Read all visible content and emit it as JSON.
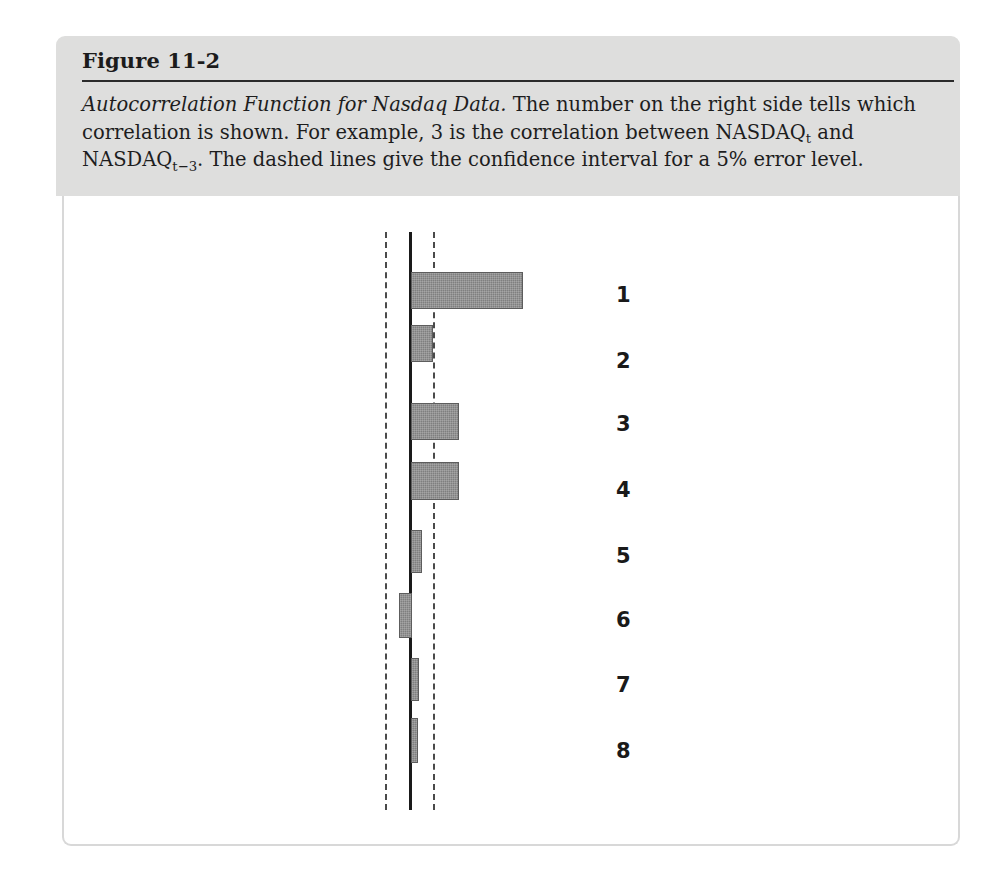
{
  "figure": {
    "label": "Figure 11-2",
    "caption_title": "Autocorrelation Function for Nasdaq Data.",
    "caption_part1": " The number on the right side tells which correlation is shown. For example, 3 is the correlation between NASDAQ",
    "caption_sub1": "t",
    "caption_part2": " and NASDAQ",
    "caption_sub2": "t−3",
    "caption_part3": ". The dashed lines give the confidence interval for a 5% error level."
  },
  "colors": {
    "header_background": "#dededd",
    "bar_fill": "#7f7f7f",
    "bar_stroke": "#5d5d5d",
    "axis": "#1a1a1a",
    "confidence_line": "#4a4a4a",
    "panel_border": "#d8d8d8",
    "text": "#1a1a1a"
  },
  "chart_data": {
    "type": "bar",
    "orientation": "horizontal",
    "title": "Autocorrelation Function for Nasdaq Data",
    "xlabel": "",
    "ylabel": "",
    "categories": [
      "1",
      "2",
      "3",
      "4",
      "5",
      "6",
      "7",
      "8"
    ],
    "series": [
      {
        "name": "Autocorrelation",
        "values": [
          0.52,
          0.1,
          0.22,
          0.22,
          0.05,
          -0.055,
          0.035,
          0.03
        ]
      }
    ],
    "confidence_interval": {
      "label": "5% error level",
      "lower": -0.12,
      "upper": 0.12,
      "line_style": "dashed"
    },
    "xlim": [
      -0.12,
      0.55
    ],
    "grid": false,
    "legend": null,
    "zero_line": 0,
    "annotations": [
      {
        "text": "1",
        "lag": 1
      },
      {
        "text": "2",
        "lag": 2
      },
      {
        "text": "3",
        "lag": 3
      },
      {
        "text": "4",
        "lag": 4
      },
      {
        "text": "5",
        "lag": 5
      },
      {
        "text": "6",
        "lag": 6
      },
      {
        "text": "7",
        "lag": 7
      },
      {
        "text": "8",
        "lag": 8
      }
    ]
  },
  "geometry": {
    "axis_x": 411,
    "ci_lower_x": 385,
    "ci_upper_x": 433,
    "bars": [
      {
        "lag": "1",
        "left": 411,
        "width": 112,
        "top": 272,
        "height": 37,
        "label_y": 283
      },
      {
        "lag": "2",
        "left": 411,
        "width": 22,
        "top": 325,
        "height": 37,
        "label_y": 349
      },
      {
        "lag": "3",
        "left": 411,
        "width": 48,
        "top": 403,
        "height": 37,
        "label_y": 412
      },
      {
        "lag": "4",
        "left": 411,
        "width": 48,
        "top": 462,
        "height": 38,
        "label_y": 478
      },
      {
        "lag": "5",
        "left": 411,
        "width": 11,
        "top": 530,
        "height": 43,
        "label_y": 544
      },
      {
        "lag": "6",
        "left": 399,
        "width": 13,
        "top": 593,
        "height": 45,
        "label_y": 608
      },
      {
        "lag": "7",
        "left": 411,
        "width": 8,
        "top": 658,
        "height": 43,
        "label_y": 673
      },
      {
        "lag": "8",
        "left": 411,
        "width": 7,
        "top": 718,
        "height": 45,
        "label_y": 739
      }
    ],
    "label_x": 616
  }
}
